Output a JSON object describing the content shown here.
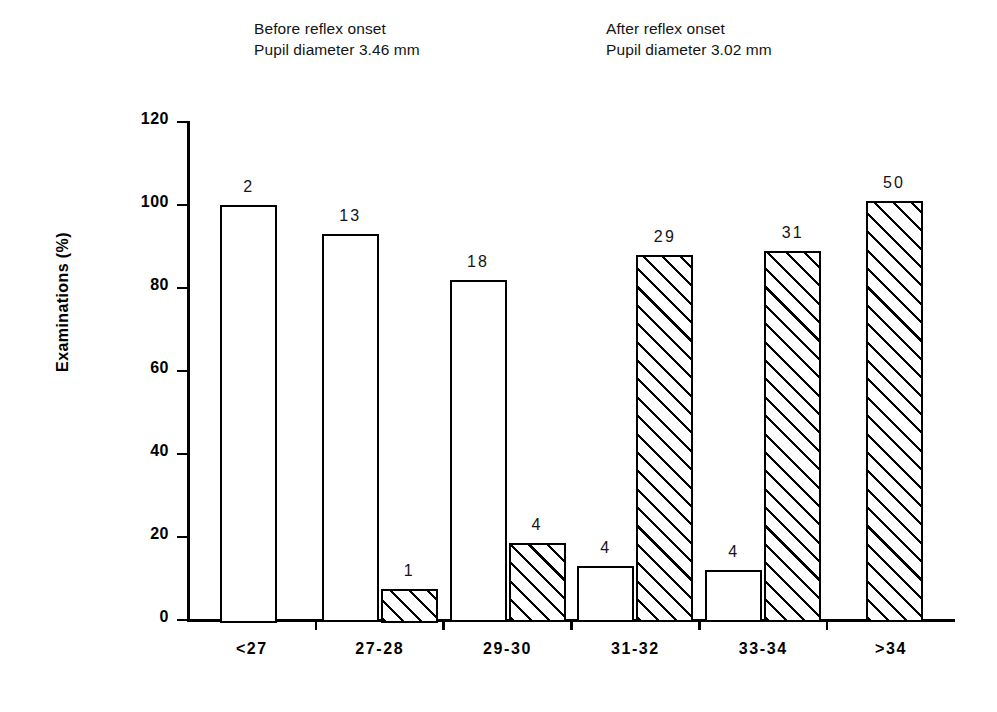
{
  "headers": {
    "before": {
      "line1": "Before reflex onset",
      "line2": "Pupil diameter 3.46 mm"
    },
    "after": {
      "line1": "After reflex onset",
      "line2": "Pupil diameter 3.02 mm"
    }
  },
  "chart_data": {
    "type": "bar",
    "title": "",
    "xlabel": "",
    "ylabel": "Examinations  (%)",
    "ylim": [
      0,
      120
    ],
    "yticks": [
      0,
      20,
      40,
      60,
      80,
      100,
      120
    ],
    "ytick_labels": [
      "0",
      "20",
      "40",
      "60",
      "80",
      "100",
      "120"
    ],
    "grid": false,
    "legend": "none",
    "categories": [
      "<27",
      "27-28",
      "29-30",
      "31-32",
      "33-34",
      ">34"
    ],
    "series": [
      {
        "name": "Before reflex onset",
        "style": "open",
        "values": [
          100,
          93,
          82,
          13,
          12,
          null
        ],
        "counts": [
          "2",
          "13",
          "18",
          "4",
          "4",
          null
        ]
      },
      {
        "name": "After reflex onset",
        "style": "hatched",
        "values": [
          null,
          7.5,
          18.5,
          88,
          89,
          101
        ],
        "counts": [
          null,
          "1",
          "4",
          "29",
          "31",
          "50"
        ]
      }
    ]
  },
  "colors": {
    "ink": "#000000",
    "background": "#ffffff",
    "text": "#141414"
  }
}
